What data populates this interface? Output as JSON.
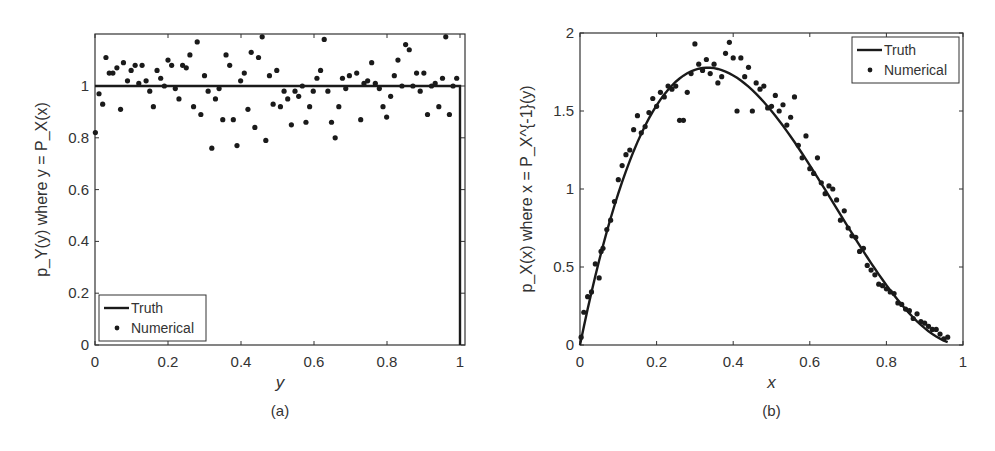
{
  "chart_data": [
    {
      "panel": "(a)",
      "type": "scatter",
      "title": "",
      "xlabel": "y",
      "ylabel": "p_Y(y) where y = P_X(x)",
      "xlim": [
        0,
        1.0
      ],
      "ylim": [
        0,
        1.2
      ],
      "xticks": [
        0,
        0.2,
        0.4,
        0.6,
        0.8,
        1
      ],
      "xtick_labels": [
        "0",
        "0.2",
        "0.4",
        "0.6",
        "0.8",
        "1"
      ],
      "yticks": [
        0,
        0.2,
        0.4,
        0.6,
        0.8,
        1
      ],
      "ytick_labels": [
        "0",
        "0.2",
        "0.4",
        "0.6",
        "0.8",
        "1"
      ],
      "grid": false,
      "legend_position": "lower left",
      "legend": [
        "Truth",
        "Numerical"
      ],
      "series": [
        {
          "name": "Truth",
          "kind": "line",
          "x": [
            0,
            1,
            1
          ],
          "y": [
            1,
            1,
            0
          ]
        },
        {
          "name": "Numerical",
          "kind": "points",
          "x": [
            0.001,
            0.011,
            0.021,
            0.03,
            0.039,
            0.049,
            0.06,
            0.07,
            0.078,
            0.089,
            0.099,
            0.11,
            0.12,
            0.129,
            0.14,
            0.15,
            0.16,
            0.17,
            0.18,
            0.19,
            0.2,
            0.21,
            0.22,
            0.23,
            0.24,
            0.25,
            0.26,
            0.27,
            0.28,
            0.29,
            0.3,
            0.31,
            0.32,
            0.33,
            0.34,
            0.35,
            0.359,
            0.369,
            0.379,
            0.389,
            0.399,
            0.409,
            0.419,
            0.428,
            0.438,
            0.448,
            0.458,
            0.468,
            0.478,
            0.488,
            0.498,
            0.508,
            0.518,
            0.528,
            0.538,
            0.548,
            0.558,
            0.568,
            0.578,
            0.588,
            0.598,
            0.608,
            0.618,
            0.628,
            0.638,
            0.648,
            0.658,
            0.668,
            0.678,
            0.687,
            0.697,
            0.717,
            0.728,
            0.737,
            0.747,
            0.758,
            0.768,
            0.779,
            0.789,
            0.799,
            0.81,
            0.82,
            0.83,
            0.841,
            0.851,
            0.861,
            0.871,
            0.881,
            0.891,
            0.901,
            0.911,
            0.922,
            0.932,
            0.942,
            0.952,
            0.961,
            0.971,
            0.981,
            0.991
          ],
          "y": [
            0.82,
            0.97,
            0.93,
            1.11,
            1.05,
            1.05,
            1.07,
            0.91,
            1.09,
            1.02,
            1.06,
            1.08,
            1.01,
            1.08,
            1.02,
            0.98,
            0.92,
            1.06,
            1.03,
            1.0,
            1.1,
            1.08,
            0.99,
            0.95,
            1.08,
            1.07,
            1.12,
            0.92,
            1.17,
            0.89,
            1.04,
            0.98,
            0.76,
            0.95,
            0.99,
            0.87,
            1.12,
            1.08,
            0.87,
            0.77,
            1.02,
            1.05,
            0.91,
            1.13,
            0.84,
            1.11,
            1.19,
            0.79,
            1.04,
            0.93,
            1.06,
            0.92,
            0.98,
            0.95,
            0.85,
            0.98,
            0.96,
            1.0,
            0.86,
            0.92,
            0.98,
            1.03,
            1.06,
            1.18,
            0.98,
            0.86,
            0.8,
            0.92,
            1.03,
            0.99,
            1.04,
            1.05,
            0.87,
            1.01,
            1.02,
            1.09,
            1.01,
            0.99,
            0.92,
            0.88,
            0.96,
            1.04,
            1.1,
            1.0,
            1.16,
            1.14,
            1.0,
            1.05,
            0.98,
            1.05,
            0.89,
            1.0,
            1.01,
            0.92,
            1.03,
            1.19,
            0.89,
            1.0,
            1.03
          ]
        }
      ],
      "caption": "(a)"
    },
    {
      "panel": "(b)",
      "type": "scatter",
      "title": "",
      "xlabel": "x",
      "ylabel": "p_X(x) where x = P_X^{-1}(y)",
      "xlim": [
        0,
        1
      ],
      "ylim": [
        0,
        2
      ],
      "xticks": [
        0,
        0.2,
        0.4,
        0.6,
        0.8,
        1
      ],
      "xtick_labels": [
        "0",
        "0.2",
        "0.4",
        "0.6",
        "0.8",
        "1"
      ],
      "yticks": [
        0,
        0.5,
        1,
        1.5,
        2
      ],
      "ytick_labels": [
        "0",
        "0.5",
        "1",
        "1.5",
        "2"
      ],
      "grid": false,
      "legend_position": "upper right",
      "legend": [
        "Truth",
        "Numerical"
      ],
      "series": [
        {
          "name": "Truth",
          "kind": "line",
          "formula": "12*x*(1-x)^2",
          "x_range": [
            0,
            0.96
          ]
        },
        {
          "name": "Numerical",
          "kind": "points",
          "x": [
            0.003,
            0.01,
            0.02,
            0.03,
            0.04,
            0.05,
            0.055,
            0.06,
            0.07,
            0.08,
            0.09,
            0.1,
            0.11,
            0.12,
            0.13,
            0.14,
            0.15,
            0.16,
            0.17,
            0.18,
            0.19,
            0.2,
            0.21,
            0.22,
            0.23,
            0.24,
            0.25,
            0.26,
            0.27,
            0.28,
            0.29,
            0.3,
            0.31,
            0.32,
            0.33,
            0.34,
            0.35,
            0.36,
            0.37,
            0.38,
            0.39,
            0.4,
            0.41,
            0.42,
            0.43,
            0.44,
            0.45,
            0.46,
            0.47,
            0.48,
            0.49,
            0.5,
            0.51,
            0.52,
            0.53,
            0.54,
            0.55,
            0.56,
            0.57,
            0.58,
            0.59,
            0.6,
            0.61,
            0.62,
            0.63,
            0.64,
            0.65,
            0.66,
            0.67,
            0.68,
            0.69,
            0.7,
            0.71,
            0.72,
            0.73,
            0.74,
            0.75,
            0.76,
            0.77,
            0.78,
            0.79,
            0.8,
            0.81,
            0.82,
            0.83,
            0.84,
            0.85,
            0.86,
            0.87,
            0.88,
            0.89,
            0.9,
            0.91,
            0.92,
            0.93,
            0.94,
            0.95,
            0.96
          ],
          "y": [
            0.05,
            0.21,
            0.31,
            0.34,
            0.52,
            0.43,
            0.6,
            0.62,
            0.74,
            0.8,
            0.92,
            1.06,
            1.15,
            1.22,
            1.25,
            1.38,
            1.47,
            1.36,
            1.4,
            1.49,
            1.58,
            1.53,
            1.62,
            1.59,
            1.66,
            1.64,
            1.66,
            1.44,
            1.44,
            1.62,
            1.74,
            1.93,
            1.8,
            1.76,
            1.83,
            1.74,
            1.8,
            1.68,
            1.72,
            1.87,
            1.94,
            1.84,
            1.5,
            1.84,
            1.72,
            1.78,
            1.5,
            1.68,
            1.64,
            1.66,
            1.52,
            1.53,
            1.6,
            1.5,
            1.54,
            1.41,
            1.46,
            1.59,
            1.28,
            1.2,
            1.34,
            1.13,
            1.1,
            1.2,
            1.04,
            0.97,
            1.02,
            1.0,
            0.93,
            0.8,
            0.86,
            0.75,
            0.7,
            0.69,
            0.6,
            0.62,
            0.51,
            0.48,
            0.45,
            0.39,
            0.38,
            0.36,
            0.34,
            0.33,
            0.27,
            0.26,
            0.23,
            0.22,
            0.17,
            0.2,
            0.15,
            0.14,
            0.12,
            0.1,
            0.1,
            0.07,
            0.04,
            0.05
          ]
        }
      ],
      "caption": "(b)"
    }
  ]
}
